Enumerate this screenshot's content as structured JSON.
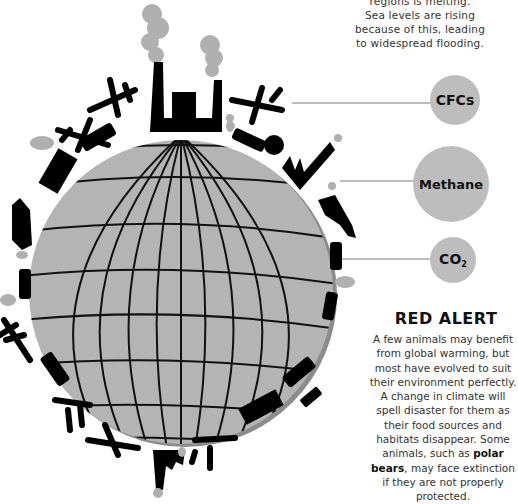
{
  "intro": {
    "lines": [
      "regions is melting.",
      "Sea levels are rising",
      "because of this, leading",
      "to widespread flooding."
    ]
  },
  "gases": [
    {
      "label": "CFCs",
      "sub": ""
    },
    {
      "label": "Methane",
      "sub": ""
    },
    {
      "label": "CO",
      "sub": "2"
    }
  ],
  "red_alert": {
    "title": "RED ALERT",
    "body_before": "A few animals may benefit from global warming, but most have evolved to suit their environment perfectly. A change in climate will spell disaster for them as their food sources and habitats disappear. Some animals, such as ",
    "body_bold": "polar bears",
    "body_after": ", may face extinction if they are not properly protected."
  },
  "illustration": {
    "subject": "globe-with-pollution-sources",
    "icons": [
      "factory-icon",
      "airplane-icon",
      "car-icon",
      "truck-icon",
      "cow-icon",
      "smoke-icon"
    ],
    "colors": {
      "globe": "#b4b4b4",
      "globe_shadow": "#8c8c8c",
      "icon": "#000000",
      "smoke": "#b0b0b0",
      "bubble": "#bdbdbd"
    }
  }
}
